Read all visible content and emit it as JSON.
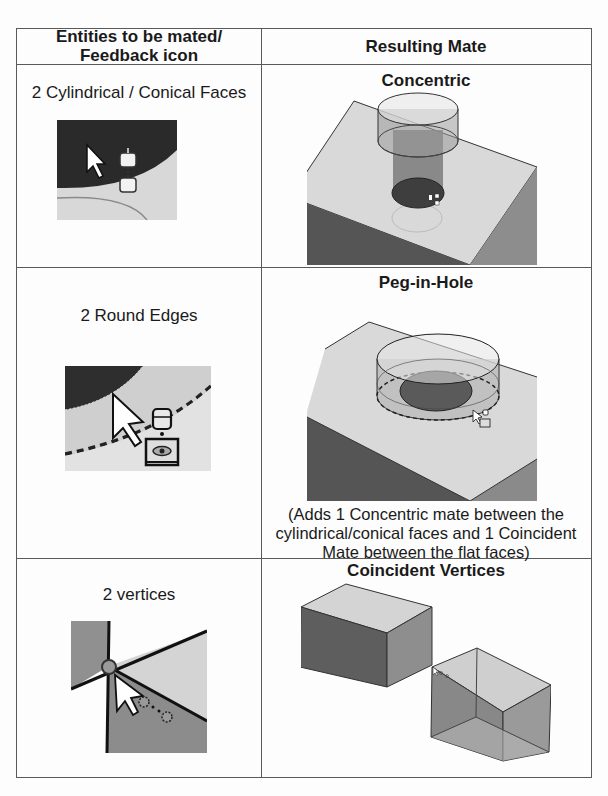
{
  "table": {
    "headers": {
      "col1_line1": "Entities to be mated/",
      "col1_line2": "Feedback icon",
      "col2": "Resulting Mate"
    },
    "rows": [
      {
        "entities": "2 Cylindrical / Conical Faces",
        "feedback_icon": "concentric-feedback-icon",
        "mate": "Concentric",
        "figure": "cylinder-in-block-concentric"
      },
      {
        "entities": "2 Round Edges",
        "feedback_icon": "peg-in-hole-feedback-icon",
        "mate": "Peg-in-Hole",
        "figure": "cylinder-peg-in-hole",
        "note_line1": "(Adds 1 Concentric mate between the",
        "note_line2": "cylindrical/conical faces  and 1 Coincident",
        "note_line3": "Mate between the flat faces)"
      },
      {
        "entities": "2 vertices",
        "feedback_icon": "vertex-feedback-icon",
        "mate": "Coincident Vertices",
        "figure": "two-blocks-coincident-vertices"
      }
    ]
  },
  "colors": {
    "border": "#5a5a5a",
    "dark_face": "#5e5e5e",
    "mid_face": "#8d8d8d",
    "light_face": "#d4d4d4"
  }
}
